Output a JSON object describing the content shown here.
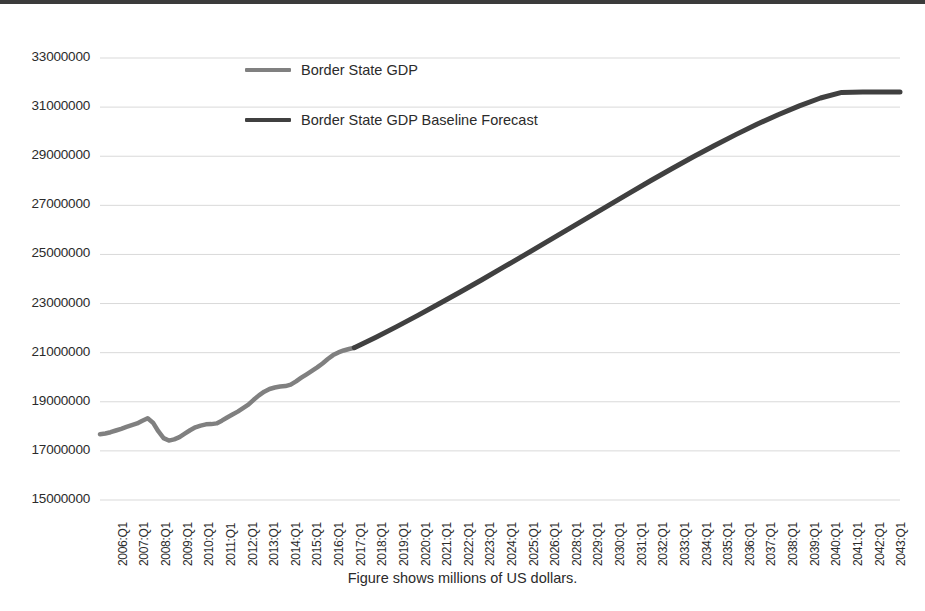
{
  "chart_data": {
    "type": "line",
    "title": "",
    "subtitle": "",
    "caption": "Figure shows millions of US dollars.",
    "xlabel": "",
    "ylabel": "",
    "ylim": [
      15000000,
      33000000
    ],
    "ytick_step": 2000000,
    "yticks": [
      "33000000",
      "31000000",
      "29000000",
      "27000000",
      "25000000",
      "23000000",
      "21000000",
      "19000000",
      "17000000",
      "15000000"
    ],
    "grid": true,
    "grid_axis": "y",
    "legend_position": "top-center",
    "legend": [
      {
        "name": "Border State GDP",
        "color": "#808080"
      },
      {
        "name": "Border State GDP Baseline Forecast",
        "color": "#404040"
      }
    ],
    "xticks": [
      "2006:Q1",
      "2007:Q1",
      "2008:Q1",
      "2009:Q1",
      "2010:Q1",
      "2011:Q1",
      "2012:Q1",
      "2013:Q1",
      "2014:Q1",
      "2015:Q1",
      "2016:Q1",
      "2017:Q1",
      "2018:Q1",
      "2019:Q1",
      "2020:Q1",
      "2021:Q1",
      "2022:Q1",
      "2023:Q1",
      "2024:Q1",
      "2025:Q1",
      "2026:Q1",
      "2028:Q1",
      "2029:Q1",
      "2030:Q1",
      "2031:Q1",
      "2032:Q1",
      "2033:Q1",
      "2034:Q1",
      "2035:Q1",
      "2036:Q1",
      "2037:Q1",
      "2038:Q1",
      "2039:Q1",
      "2040:Q1",
      "2041:Q1",
      "2042:Q1",
      "2043:Q1"
    ],
    "series": [
      {
        "name": "Border State GDP",
        "color": "#808080",
        "width": 4.5,
        "x": [
          2006.0,
          2006.25,
          2006.5,
          2006.75,
          2007.0,
          2007.25,
          2007.5,
          2007.75,
          2008.0,
          2008.25,
          2008.5,
          2008.75,
          2009.0,
          2009.25,
          2009.5,
          2009.75,
          2010.0,
          2010.25,
          2010.5,
          2010.75,
          2011.0,
          2011.25,
          2011.5,
          2011.75,
          2012.0,
          2012.25,
          2012.5,
          2012.75,
          2013.0,
          2013.25,
          2013.5,
          2013.75,
          2014.0,
          2014.25,
          2014.5,
          2014.75,
          2015.0,
          2015.25,
          2015.5,
          2015.75,
          2016.0,
          2016.25,
          2016.5,
          2016.75,
          2017.0,
          2017.25,
          2017.5,
          2017.75,
          2018.0
        ],
        "y": [
          17680000,
          17710000,
          17760000,
          17830000,
          17900000,
          17980000,
          18050000,
          18120000,
          18230000,
          18330000,
          18150000,
          17800000,
          17520000,
          17420000,
          17470000,
          17560000,
          17700000,
          17840000,
          17960000,
          18030000,
          18080000,
          18090000,
          18120000,
          18230000,
          18360000,
          18480000,
          18600000,
          18740000,
          18880000,
          19080000,
          19260000,
          19410000,
          19520000,
          19580000,
          19620000,
          19640000,
          19700000,
          19830000,
          19980000,
          20120000,
          20260000,
          20400000,
          20560000,
          20740000,
          20900000,
          21010000,
          21090000,
          21150000,
          21200000
        ]
      },
      {
        "name": "Border State GDP Baseline Forecast",
        "color": "#404040",
        "width": 5,
        "x": [
          2018.0,
          2019.0,
          2020.0,
          2021.0,
          2022.0,
          2023.0,
          2024.0,
          2025.0,
          2026.0,
          2027.0,
          2028.0,
          2029.0,
          2030.0,
          2031.0,
          2032.0,
          2033.0,
          2034.0,
          2035.0,
          2036.0,
          2037.0,
          2038.0,
          2039.0,
          2040.0,
          2041.0,
          2042.0,
          2043.0,
          2043.75
        ],
        "y": [
          21200000,
          21620000,
          22060000,
          22520000,
          22990000,
          23470000,
          23960000,
          24460000,
          24960000,
          25470000,
          25980000,
          26490000,
          27000000,
          27510000,
          28010000,
          28500000,
          28980000,
          29440000,
          29880000,
          30300000,
          30690000,
          31050000,
          31370000,
          31600000,
          31620000,
          31620000,
          31620000
        ]
      }
    ]
  }
}
